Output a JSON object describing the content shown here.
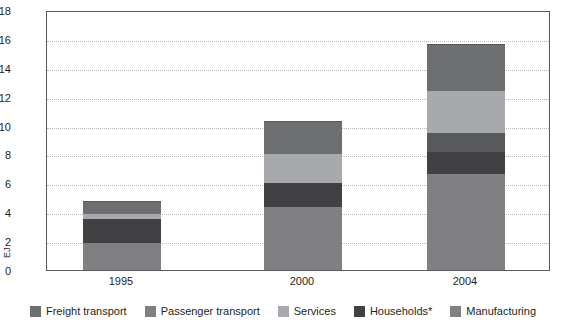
{
  "chart_data": {
    "type": "bar",
    "subtype": "stacked",
    "title": "",
    "xlabel": "",
    "ylabel": "EJ",
    "ylim": [
      0,
      18
    ],
    "ytick_step": 2,
    "yticks": [
      "18",
      "16",
      "14",
      "12",
      "10",
      "8",
      "6",
      "4",
      "2",
      "0"
    ],
    "grid": true,
    "legend_position": "bottom",
    "categories": [
      "1995",
      "2000",
      "2004"
    ],
    "series": [
      {
        "name": "Freight transport",
        "color": "#808082",
        "values": [
          1.9,
          4.35,
          6.65
        ]
      },
      {
        "name": "Households*",
        "color": "#414042",
        "values": [
          1.6,
          1.7,
          1.55
        ]
      },
      {
        "name": "Passenger transport",
        "color": "#58595b",
        "values": [
          0.0,
          0.0,
          1.3
        ]
      },
      {
        "name": "Services",
        "color": "#a7a9ac",
        "values": [
          0.35,
          2.0,
          2.9
        ]
      },
      {
        "name": "Manufacturing",
        "color": "#6d6e70",
        "values": [
          0.85,
          2.2,
          3.15
        ]
      }
    ],
    "totals": [
      4.7,
      10.25,
      15.55
    ]
  },
  "legend": {
    "items": [
      {
        "label": "Freight transport",
        "color": "#6d6e70"
      },
      {
        "label": "Passenger transport",
        "color": "#808082"
      },
      {
        "label": "Services",
        "color": "#a7a9ac"
      },
      {
        "label": "Households*",
        "color": "#414042"
      },
      {
        "label": "Manufacturing",
        "color": "#808082"
      }
    ]
  },
  "axis": {
    "y_label": "EJ"
  }
}
